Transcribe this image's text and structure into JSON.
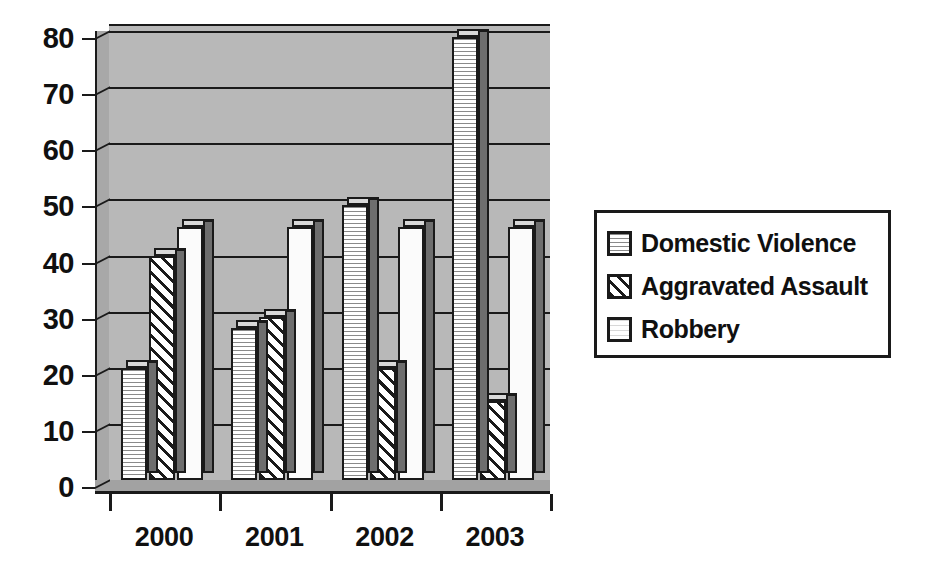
{
  "chart_data": {
    "type": "bar",
    "title": "",
    "subtitle": "",
    "xlabel": "",
    "ylabel": "",
    "categories": [
      "2000",
      "2001",
      "2002",
      "2003"
    ],
    "series": [
      {
        "name": "Domestic Violence",
        "pattern": "dotted-stipple",
        "values": [
          20,
          27,
          49,
          79
        ]
      },
      {
        "name": "Aggravated Assault",
        "pattern": "diagonal-hatch",
        "values": [
          40,
          29,
          20,
          14
        ]
      },
      {
        "name": "Robbery",
        "pattern": "solid-white",
        "values": [
          45,
          45,
          45,
          45
        ]
      }
    ],
    "ylim": [
      0,
      80
    ],
    "ytick_step": 10,
    "yticks": [
      "0",
      "10",
      "20",
      "30",
      "40",
      "50",
      "60",
      "70",
      "80"
    ],
    "grid": true,
    "grid_axis": "y",
    "legend_position": "right",
    "style": "3d-column",
    "colors": {
      "plot_background": "#b8b8b8",
      "plot_sidewall": "#a8a8a8",
      "floor": "#a2a2a2",
      "gridline": "#1a1a1a",
      "bar_outline": "#1a1a1a",
      "bar_side_shadow": "#6e6e6e",
      "bar_top": "#d9d9d9",
      "text": "#101010",
      "page_background": "#ffffff",
      "legend_border": "#1a1a1a"
    }
  },
  "legend": {
    "items": [
      {
        "label": "Domestic Violence",
        "swatch": "dotted-stipple-swatch"
      },
      {
        "label": "Aggravated Assault",
        "swatch": "diagonal-hatch-swatch"
      },
      {
        "label": "Robbery",
        "swatch": "solid-white-swatch"
      }
    ]
  }
}
